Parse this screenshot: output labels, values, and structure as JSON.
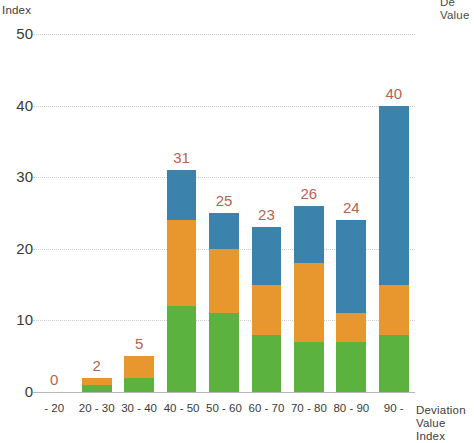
{
  "chart_data": {
    "type": "bar",
    "stacked": true,
    "title": "",
    "xlabel": "Deviation Value Index",
    "ylabel": "Index",
    "ylim": [
      0,
      50
    ],
    "yticks": [
      0,
      10,
      20,
      30,
      40,
      50
    ],
    "grid": true,
    "legend_position": "none",
    "categories": [
      "- 20",
      "20 - 30",
      "30 - 40",
      "40 - 50",
      "50 - 60",
      "60 - 70",
      "70 - 80",
      "80 - 90",
      "90 -"
    ],
    "series": [
      {
        "name": "green",
        "color": "#5CB23E",
        "values": [
          0,
          1,
          2,
          12,
          11,
          8,
          7,
          7,
          8
        ]
      },
      {
        "name": "orange",
        "color": "#E8962E",
        "values": [
          0,
          1,
          3,
          12,
          9,
          7,
          11,
          4,
          7
        ]
      },
      {
        "name": "blue",
        "color": "#3B83AC",
        "values": [
          0,
          0,
          0,
          7,
          5,
          8,
          8,
          13,
          25
        ]
      }
    ],
    "totals": [
      0,
      2,
      5,
      31,
      25,
      23,
      26,
      24,
      40
    ],
    "total_label_color": "#B5644F"
  },
  "labels": {
    "y_axis_title": "Index",
    "x_axis_title": "Deviation\nValue Index",
    "series_title_clipped": "De\nValue"
  }
}
